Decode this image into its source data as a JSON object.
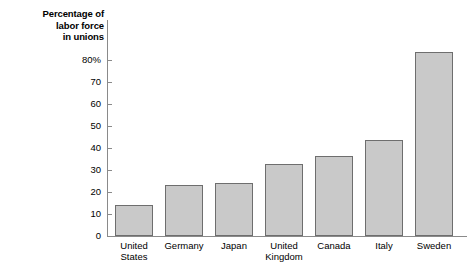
{
  "chart_data": {
    "type": "bar",
    "title": "",
    "ylabel": "Percentage of labor force in unions",
    "ylabel_lines": [
      "Percentage of",
      "labor force",
      "in unions"
    ],
    "xlabel": "",
    "categories": [
      "United States",
      "Germany",
      "Japan",
      "United Kingdom",
      "Canada",
      "Italy",
      "Sweden"
    ],
    "category_lines": [
      [
        "United",
        "States"
      ],
      [
        "Germany"
      ],
      [
        "Japan"
      ],
      [
        "United",
        "Kingdom"
      ],
      [
        "Canada"
      ],
      [
        "Italy"
      ],
      [
        "Sweden"
      ]
    ],
    "values": [
      11.5,
      19,
      19.5,
      26.5,
      29.5,
      35.5,
      68
    ],
    "ylim": [
      0,
      80
    ],
    "ytick_values": [
      0,
      10,
      20,
      30,
      40,
      50,
      60,
      70,
      80
    ],
    "ytick_labels": [
      "0",
      "10",
      "20",
      "30",
      "40",
      "50",
      "60",
      "70",
      "80%"
    ],
    "grid": false,
    "legend": false,
    "bar_color": "#c9c9c9",
    "bar_border_color": "#6e6e6e",
    "axis_color": "#8a8a8a",
    "background": "#ffffff"
  }
}
